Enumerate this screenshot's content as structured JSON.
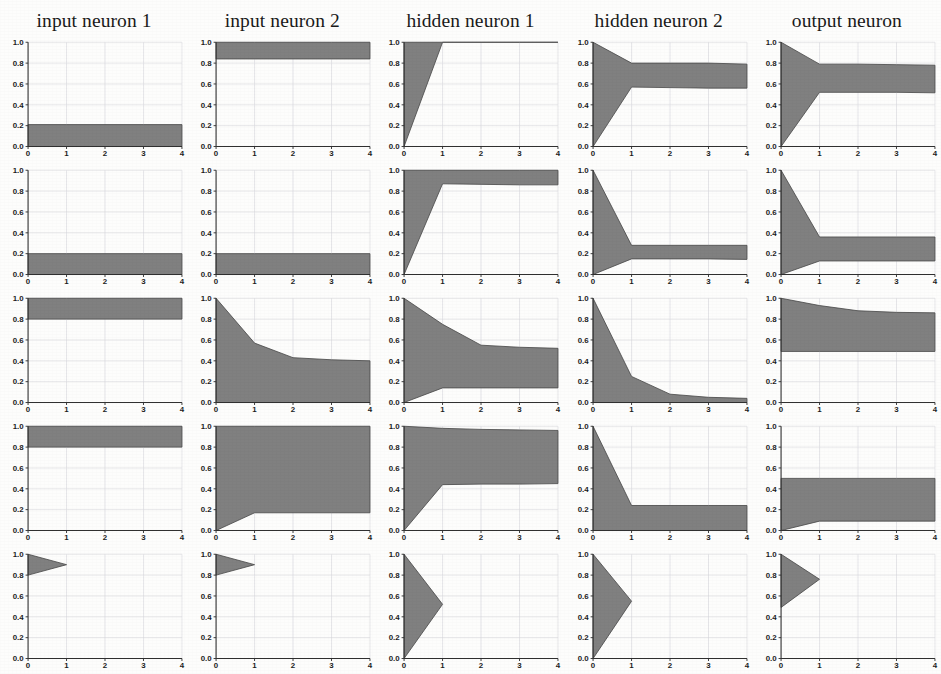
{
  "figure": {
    "background_color": "#fdfdfc",
    "band_fill_color": "#808080",
    "band_edge_color": "#4a4a4a",
    "grid_color": "#d8d8dd",
    "axis_color": "#303030",
    "rows": 5,
    "columns": 5
  },
  "column_titles": [
    "input neuron 1",
    "input neuron 2",
    "hidden neuron 1",
    "hidden neuron 2",
    "output neuron"
  ],
  "axes": {
    "x_ticks": [
      "0",
      "1",
      "2",
      "3",
      "4"
    ],
    "y_ticks": [
      "0.0",
      "0.2",
      "0.4",
      "0.6",
      "0.8",
      "1.0"
    ],
    "xlim": [
      0,
      4
    ],
    "ylim": [
      0.0,
      1.0
    ]
  },
  "chart_data": {
    "type": "area",
    "title": "",
    "xlabel": "",
    "ylabel": "",
    "xlim": [
      0,
      4
    ],
    "ylim": [
      0,
      1
    ],
    "grid": true,
    "legend": "none",
    "columns": [
      "input neuron 1",
      "input neuron 2",
      "hidden neuron 1",
      "hidden neuron 2",
      "output neuron"
    ],
    "x": [
      0,
      1,
      2,
      3,
      4
    ],
    "panels": [
      {
        "row": 0,
        "col": 0,
        "column_title": "input neuron 1",
        "x": [
          0,
          1,
          2,
          3,
          4
        ],
        "upper": [
          0.21,
          0.21,
          0.21,
          0.21,
          0.21
        ],
        "lower": [
          0.0,
          0.0,
          0.0,
          0.0,
          0.0
        ]
      },
      {
        "row": 0,
        "col": 1,
        "column_title": "input neuron 2",
        "x": [
          0,
          1,
          2,
          3,
          4
        ],
        "upper": [
          1.0,
          1.0,
          1.0,
          1.0,
          1.0
        ],
        "lower": [
          0.84,
          0.84,
          0.84,
          0.84,
          0.84
        ]
      },
      {
        "row": 0,
        "col": 2,
        "column_title": "hidden neuron 1",
        "x": [
          0,
          1,
          2,
          3,
          4
        ],
        "upper": [
          1.0,
          1.0,
          1.0,
          1.0,
          1.0
        ],
        "lower": [
          0.0,
          1.0,
          1.0,
          1.0,
          1.0
        ]
      },
      {
        "row": 0,
        "col": 3,
        "column_title": "hidden neuron 2",
        "x": [
          0,
          1,
          2,
          3,
          4
        ],
        "upper": [
          1.0,
          0.8,
          0.8,
          0.8,
          0.79
        ],
        "lower": [
          0.0,
          0.57,
          0.565,
          0.56,
          0.56
        ]
      },
      {
        "row": 0,
        "col": 4,
        "column_title": "output neuron",
        "x": [
          0,
          1,
          2,
          3,
          4
        ],
        "upper": [
          1.0,
          0.79,
          0.79,
          0.785,
          0.78
        ],
        "lower": [
          0.0,
          0.52,
          0.52,
          0.52,
          0.515
        ]
      },
      {
        "row": 1,
        "col": 0,
        "column_title": "input neuron 1",
        "x": [
          0,
          1,
          2,
          3,
          4
        ],
        "upper": [
          0.2,
          0.2,
          0.2,
          0.2,
          0.2
        ],
        "lower": [
          0.0,
          0.0,
          0.0,
          0.0,
          0.0
        ]
      },
      {
        "row": 1,
        "col": 1,
        "column_title": "input neuron 2",
        "x": [
          0,
          1,
          2,
          3,
          4
        ],
        "upper": [
          0.2,
          0.2,
          0.2,
          0.2,
          0.2
        ],
        "lower": [
          0.0,
          0.0,
          0.0,
          0.0,
          0.0
        ]
      },
      {
        "row": 1,
        "col": 2,
        "column_title": "hidden neuron 1",
        "x": [
          0,
          1,
          2,
          3,
          4
        ],
        "upper": [
          1.0,
          1.0,
          1.0,
          1.0,
          1.0
        ],
        "lower": [
          0.0,
          0.87,
          0.865,
          0.86,
          0.86
        ]
      },
      {
        "row": 1,
        "col": 3,
        "column_title": "hidden neuron 2",
        "x": [
          0,
          1,
          2,
          3,
          4
        ],
        "upper": [
          1.0,
          0.28,
          0.28,
          0.28,
          0.28
        ],
        "lower": [
          0.0,
          0.15,
          0.15,
          0.15,
          0.145
        ]
      },
      {
        "row": 1,
        "col": 4,
        "column_title": "output neuron",
        "x": [
          0,
          1,
          2,
          3,
          4
        ],
        "upper": [
          1.0,
          0.36,
          0.36,
          0.36,
          0.36
        ],
        "lower": [
          0.0,
          0.13,
          0.13,
          0.13,
          0.13
        ]
      },
      {
        "row": 2,
        "col": 0,
        "column_title": "input neuron 1",
        "x": [
          0,
          1,
          2,
          3,
          4
        ],
        "upper": [
          1.0,
          1.0,
          1.0,
          1.0,
          1.0
        ],
        "lower": [
          0.8,
          0.8,
          0.8,
          0.8,
          0.8
        ]
      },
      {
        "row": 2,
        "col": 1,
        "column_title": "input neuron 2",
        "x": [
          0,
          1,
          2,
          3,
          4
        ],
        "upper": [
          1.0,
          0.57,
          0.43,
          0.41,
          0.4
        ],
        "lower": [
          0.0,
          0.0,
          0.0,
          0.0,
          0.0
        ]
      },
      {
        "row": 2,
        "col": 2,
        "column_title": "hidden neuron 1",
        "x": [
          0,
          1,
          2,
          3,
          4
        ],
        "upper": [
          1.0,
          0.75,
          0.55,
          0.53,
          0.52
        ],
        "lower": [
          0.0,
          0.14,
          0.14,
          0.14,
          0.14
        ]
      },
      {
        "row": 2,
        "col": 3,
        "column_title": "hidden neuron 2",
        "x": [
          0,
          1,
          2,
          3,
          4
        ],
        "upper": [
          1.0,
          0.25,
          0.08,
          0.05,
          0.04
        ],
        "lower": [
          0.0,
          0.0,
          0.0,
          0.0,
          0.0
        ]
      },
      {
        "row": 2,
        "col": 4,
        "column_title": "output neuron",
        "x": [
          0,
          1,
          2,
          3,
          4
        ],
        "upper": [
          1.0,
          0.93,
          0.88,
          0.865,
          0.86
        ],
        "lower": [
          0.49,
          0.49,
          0.49,
          0.49,
          0.49
        ]
      },
      {
        "row": 3,
        "col": 0,
        "column_title": "input neuron 1",
        "x": [
          0,
          1,
          2,
          3,
          4
        ],
        "upper": [
          1.0,
          1.0,
          1.0,
          1.0,
          1.0
        ],
        "lower": [
          0.8,
          0.8,
          0.8,
          0.8,
          0.8
        ]
      },
      {
        "row": 3,
        "col": 1,
        "column_title": "input neuron 2",
        "x": [
          0,
          1,
          2,
          3,
          4
        ],
        "upper": [
          1.0,
          1.0,
          1.0,
          1.0,
          1.0
        ],
        "lower": [
          0.0,
          0.17,
          0.17,
          0.17,
          0.17
        ]
      },
      {
        "row": 3,
        "col": 2,
        "column_title": "hidden neuron 1",
        "x": [
          0,
          1,
          2,
          3,
          4
        ],
        "upper": [
          1.0,
          0.98,
          0.97,
          0.965,
          0.96
        ],
        "lower": [
          0.0,
          0.44,
          0.445,
          0.445,
          0.45
        ]
      },
      {
        "row": 3,
        "col": 3,
        "column_title": "hidden neuron 2",
        "x": [
          0,
          1,
          2,
          3,
          4
        ],
        "upper": [
          1.0,
          0.24,
          0.24,
          0.24,
          0.24
        ],
        "lower": [
          0.0,
          0.0,
          0.0,
          0.0,
          0.0
        ]
      },
      {
        "row": 3,
        "col": 4,
        "column_title": "output neuron",
        "x": [
          0,
          1,
          2,
          3,
          4
        ],
        "upper": [
          0.5,
          0.5,
          0.5,
          0.5,
          0.5
        ],
        "lower": [
          0.0,
          0.09,
          0.09,
          0.09,
          0.09
        ]
      },
      {
        "row": 4,
        "col": 0,
        "column_title": "input neuron 1",
        "x": [
          0,
          1
        ],
        "upper": [
          1.0,
          0.9
        ],
        "lower": [
          0.8,
          0.9
        ]
      },
      {
        "row": 4,
        "col": 1,
        "column_title": "input neuron 2",
        "x": [
          0,
          1
        ],
        "upper": [
          1.0,
          0.9
        ],
        "lower": [
          0.8,
          0.9
        ]
      },
      {
        "row": 4,
        "col": 2,
        "column_title": "hidden neuron 1",
        "x": [
          0,
          1
        ],
        "upper": [
          1.0,
          0.52
        ],
        "lower": [
          0.0,
          0.52
        ]
      },
      {
        "row": 4,
        "col": 3,
        "column_title": "hidden neuron 2",
        "x": [
          0,
          1
        ],
        "upper": [
          1.0,
          0.55
        ],
        "lower": [
          0.0,
          0.55
        ]
      },
      {
        "row": 4,
        "col": 4,
        "column_title": "output neuron",
        "x": [
          0,
          1
        ],
        "upper": [
          1.0,
          0.76
        ],
        "lower": [
          0.49,
          0.76
        ]
      }
    ]
  }
}
